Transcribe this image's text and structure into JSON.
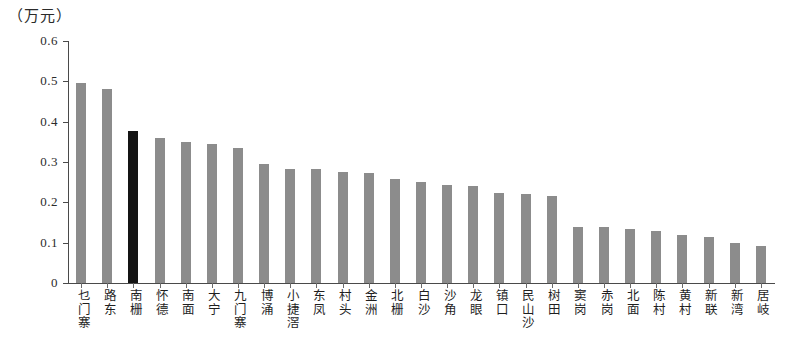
{
  "chart_data": {
    "type": "bar",
    "title": "（万元）",
    "xlabel": "",
    "ylabel": "",
    "ylim": [
      0,
      0.6
    ],
    "ytick_labels": [
      "0.6",
      "0.5",
      "0.4",
      "0.3",
      "0.2",
      "0.1",
      "0"
    ],
    "ytick_values": [
      0.6,
      0.5,
      0.4,
      0.3,
      0.2,
      0.1,
      0
    ],
    "grid": false,
    "legend": null,
    "bar_color": "#8c8c8c",
    "highlight_color": "#141414",
    "highlight_index": 2,
    "categories": [
      "乜门寨",
      "路东",
      "南栅",
      "怀德",
      "南面",
      "大宁",
      "九门寨",
      "博涌",
      "小捷滘",
      "东凤",
      "村头",
      "金洲",
      "北栅",
      "白沙",
      "沙角",
      "龙眼",
      "镇口",
      "民山沙",
      "树田",
      "窦岗",
      "赤岗",
      "北面",
      "陈村",
      "黄村",
      "新联",
      "新湾",
      "居岐"
    ],
    "values": [
      0.497,
      0.48,
      0.378,
      0.36,
      0.35,
      0.345,
      0.335,
      0.295,
      0.283,
      0.283,
      0.275,
      0.272,
      0.258,
      0.25,
      0.242,
      0.24,
      0.223,
      0.22,
      0.215,
      0.138,
      0.14,
      0.135,
      0.128,
      0.118,
      0.115,
      0.1,
      0.093
    ]
  }
}
